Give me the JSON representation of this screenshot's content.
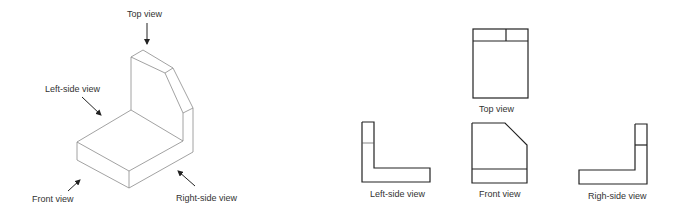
{
  "isometric": {
    "labels": {
      "top": "Top view",
      "left_side": "Left-side view",
      "front": "Front view",
      "right_side": "Right-side view"
    }
  },
  "orthographic": {
    "labels": {
      "top": "Top view",
      "left_side": "Left-side view",
      "front": "Front view",
      "right_side": "Righ-side view"
    }
  },
  "colors": {
    "line": "#222222",
    "iso_line": "#8a8a8a",
    "text": "#333333",
    "background": "#ffffff"
  }
}
